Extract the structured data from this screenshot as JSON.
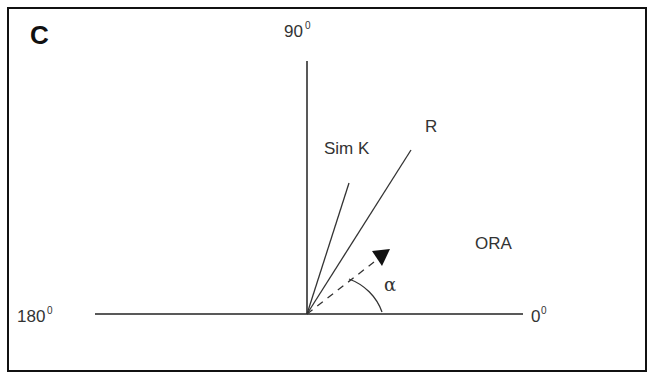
{
  "figure": {
    "panel_label": "C",
    "axes": {
      "top": {
        "value": "90",
        "sup": "0"
      },
      "left": {
        "value": "180",
        "sup": "0"
      },
      "right": {
        "value": "0",
        "sup": "0"
      }
    },
    "vectors": [
      {
        "label": "Sim K",
        "style": "solid"
      },
      {
        "label": "R",
        "style": "solid"
      },
      {
        "label": "",
        "style": "dashed-arrow"
      }
    ],
    "angle_label": "α",
    "region_label": "ORA"
  }
}
